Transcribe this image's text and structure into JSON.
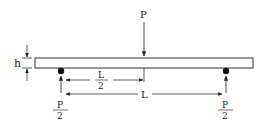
{
  "diagram": {
    "type": "three-point bending beam",
    "labels": {
      "load": "P",
      "thickness": "h",
      "half_span_num": "L",
      "half_span_den": "2",
      "span": "L",
      "left_reaction_num": "P",
      "left_reaction_den": "2",
      "right_reaction_num": "P",
      "right_reaction_den": "2"
    },
    "colors": {
      "stroke": "#222222",
      "beam_fill": "#ffffff"
    }
  }
}
